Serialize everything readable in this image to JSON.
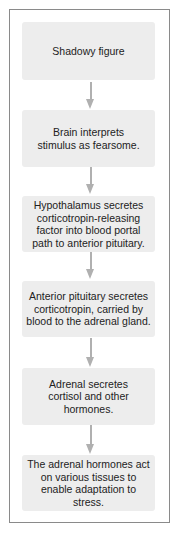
{
  "flowchart": {
    "steps": [
      {
        "label": "Shadowy figure"
      },
      {
        "label": "Brain interprets stimulus as fearsome."
      },
      {
        "label": "Hypothalamus secretes corticotropin-releasing factor into blood portal path to anterior pituitary."
      },
      {
        "label": "Anterior pituitary secretes corticotropin, carried by blood to the adrenal gland."
      },
      {
        "label": "Adrenal secretes cortisol and other hormones."
      },
      {
        "label": "The adrenal hormones act on various tissues to enable adaptation to stress."
      }
    ],
    "arrow_icon": "down-arrow-icon",
    "colors": {
      "box_fill": "#ededed",
      "arrow": "#b0b0b0",
      "frame": "#8a8a8a",
      "text": "#222222"
    }
  }
}
